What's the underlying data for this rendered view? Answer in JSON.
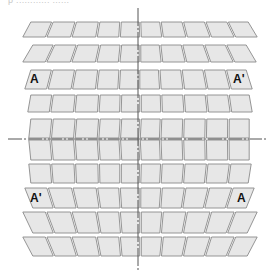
{
  "figure": {
    "caption_fragment": "p ............ ......"
  },
  "colors": {
    "cell_fill": "#e7e7e7",
    "cell_stroke": "#8a8a8a",
    "axis": "#555555",
    "label": "#111111",
    "background": "#ffffff"
  },
  "axes": {
    "vertical": {
      "x": 138,
      "y1": 8,
      "y2": 272,
      "style": "dash-dot"
    },
    "horizontal": {
      "y": 139,
      "x1": 8,
      "x2": 268,
      "style": "dash-dot"
    }
  },
  "grid": {
    "columns": 10,
    "column_weights": [
      23,
      24,
      24,
      22,
      20,
      21,
      23,
      23,
      23,
      22
    ],
    "rows": [
      {
        "y_top": 22,
        "y_bottom": 37,
        "left_top": 30,
        "left_bottom": 22,
        "right_top": 249,
        "right_bottom": 258
      },
      {
        "y_top": 45,
        "y_bottom": 62,
        "left_top": 32,
        "left_bottom": 22,
        "right_top": 247,
        "right_bottom": 257
      },
      {
        "y_top": 70,
        "y_bottom": 89,
        "left_top": 30,
        "left_bottom": 24,
        "right_top": 247,
        "right_bottom": 253
      },
      {
        "y_top": 95,
        "y_bottom": 112,
        "left_top": 30,
        "left_bottom": 27,
        "right_top": 250,
        "right_bottom": 253
      },
      {
        "y_top": 119,
        "y_bottom": 138,
        "left_top": 30,
        "left_bottom": 28,
        "right_top": 250,
        "right_bottom": 250
      },
      {
        "y_top": 140,
        "y_bottom": 160,
        "left_top": 28,
        "left_bottom": 30,
        "right_top": 250,
        "right_bottom": 250
      },
      {
        "y_top": 164,
        "y_bottom": 183,
        "left_top": 28,
        "left_bottom": 30,
        "right_top": 252,
        "right_bottom": 249
      },
      {
        "y_top": 188,
        "y_bottom": 208,
        "left_top": 24,
        "left_bottom": 32,
        "right_top": 255,
        "right_bottom": 247
      },
      {
        "y_top": 212,
        "y_bottom": 233,
        "left_top": 22,
        "left_bottom": 32,
        "right_top": 258,
        "right_bottom": 248
      },
      {
        "y_top": 237,
        "y_bottom": 256,
        "left_top": 22,
        "left_bottom": 32,
        "right_top": 258,
        "right_bottom": 248
      }
    ]
  },
  "markers": [
    {
      "text": "A",
      "x": 30,
      "y": 73,
      "position": "row-3-left"
    },
    {
      "text": "A'",
      "x": 233,
      "y": 73,
      "position": "row-3-right"
    },
    {
      "text": "A'",
      "x": 30,
      "y": 192,
      "position": "row-8-left"
    },
    {
      "text": "A",
      "x": 237,
      "y": 192,
      "position": "row-8-right"
    }
  ]
}
